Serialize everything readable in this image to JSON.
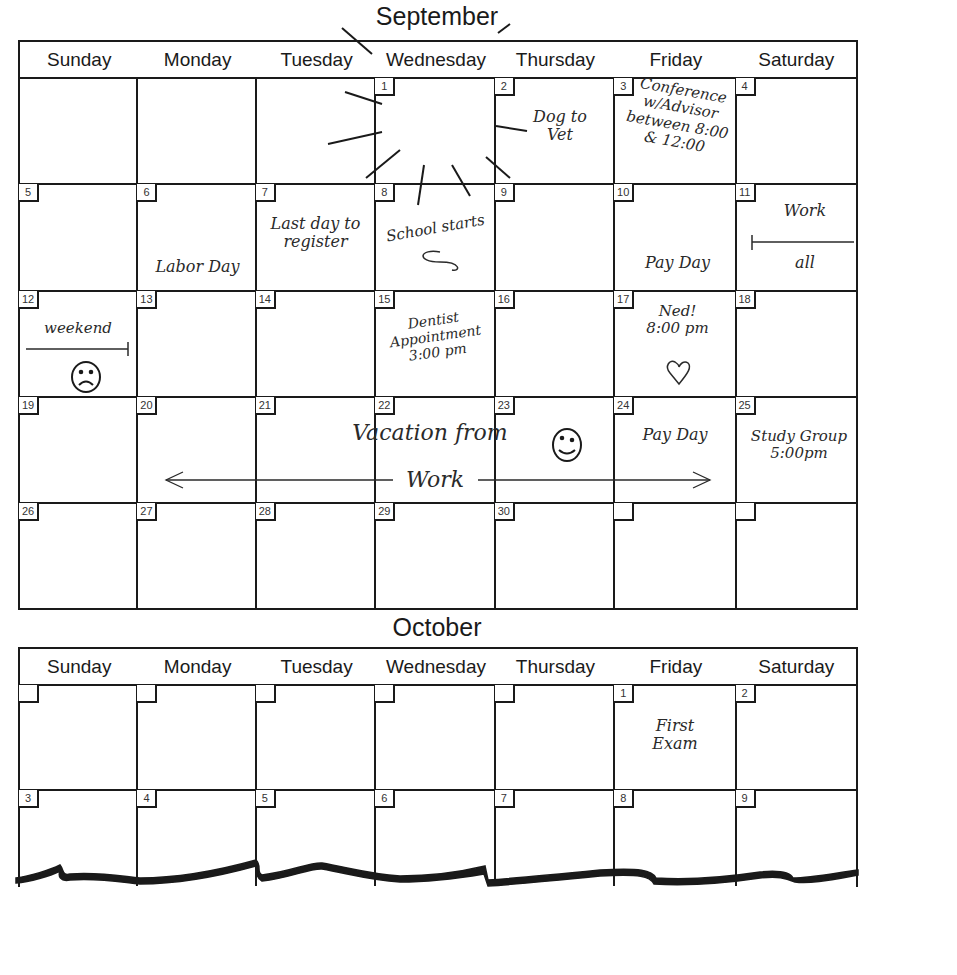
{
  "september": {
    "title": "September",
    "weekdays": [
      "Sunday",
      "Monday",
      "Tuesday",
      "Wednesday",
      "Thursday",
      "Friday",
      "Saturday"
    ],
    "weeks": [
      [
        "",
        "",
        "",
        "1",
        "2",
        "3",
        "4"
      ],
      [
        "5",
        "6",
        "7",
        "8",
        "9",
        "10",
        "11"
      ],
      [
        "12",
        "13",
        "14",
        "15",
        "16",
        "17",
        "18"
      ],
      [
        "19",
        "20",
        "21",
        "22",
        "23",
        "24",
        "25"
      ],
      [
        "26",
        "27",
        "28",
        "29",
        "30",
        "",
        ""
      ]
    ],
    "notes": {
      "dog_to_vet": "Dog to Vet",
      "conference": "Conference w/Advisor between 8:00 & 12:00",
      "labor_day": "Labor Day",
      "last_day_register": "Last day to register",
      "school_starts": "School starts",
      "pay_day_10": "Pay Day",
      "work_all_top": "Work",
      "work_all_bottom": "all",
      "weekend": "weekend",
      "dentist": "Dentist Appointment 3:00 pm",
      "ned": "Ned! 8:00 pm",
      "vacation_top": "Vacation from",
      "vacation_bottom": "Work",
      "pay_day_24": "Pay Day",
      "study_group": "Study Group 5:00pm"
    }
  },
  "october": {
    "title": "October",
    "weekdays": [
      "Sunday",
      "Monday",
      "Tuesday",
      "Wednesday",
      "Thursday",
      "Friday",
      "Saturday"
    ],
    "weeks": [
      [
        "",
        "",
        "",
        "",
        "",
        "1",
        "2"
      ],
      [
        "3",
        "4",
        "5",
        "6",
        "7",
        "8",
        "9"
      ]
    ],
    "notes": {
      "first_exam": "First Exam"
    }
  }
}
